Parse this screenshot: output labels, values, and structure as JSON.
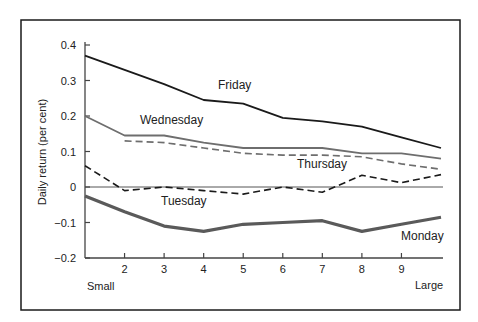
{
  "chart_data": {
    "type": "line",
    "title": "",
    "xlabel": "",
    "ylabel": "Daily return (per cent)",
    "x": [
      1,
      2,
      3,
      4,
      5,
      6,
      7,
      8,
      9,
      10
    ],
    "x_tick_labels": [
      "",
      "2",
      "3",
      "4",
      "5",
      "6",
      "7",
      "8",
      "9",
      ""
    ],
    "x_end_labels": {
      "left": "Small",
      "right": "Large"
    },
    "y_ticks": [
      0.4,
      0.3,
      0.2,
      0.1,
      0,
      -0.1,
      -0.2
    ],
    "y_tick_labels": [
      "0.4",
      "0.3",
      "0.2",
      "0.1",
      "0",
      "−0.1",
      "−0.2"
    ],
    "ylim": [
      -0.2,
      0.4
    ],
    "xlim": [
      1,
      10
    ],
    "grid": false,
    "zero_line": true,
    "legend": "inline labels",
    "series": [
      {
        "name": "Friday",
        "style": "solid",
        "color": "#1a1a1a",
        "width": 1.8,
        "values": [
          0.37,
          0.33,
          0.29,
          0.245,
          0.235,
          0.195,
          0.185,
          0.17,
          0.14,
          0.11
        ],
        "label_pos": [
          218,
          89
        ]
      },
      {
        "name": "Wednesday",
        "style": "solid",
        "color": "#6e6e6e",
        "width": 1.8,
        "values": [
          0.2,
          0.145,
          0.145,
          0.125,
          0.11,
          0.11,
          0.11,
          0.095,
          0.095,
          0.08
        ],
        "label_pos": [
          140,
          124
        ]
      },
      {
        "name": "Thursday",
        "style": "dashed",
        "color": "#6e6e6e",
        "width": 1.6,
        "values": [
          null,
          0.13,
          0.125,
          0.11,
          0.095,
          0.09,
          0.09,
          0.085,
          0.065,
          0.05
        ],
        "label_pos": [
          297,
          168
        ]
      },
      {
        "name": "Tuesday",
        "style": "dashed",
        "color": "#1a1a1a",
        "width": 1.6,
        "values": [
          0.06,
          -0.01,
          0.0,
          -0.01,
          -0.02,
          0.0,
          -0.015,
          0.033,
          0.012,
          0.035
        ],
        "label_pos": [
          161,
          205
        ]
      },
      {
        "name": "Monday",
        "style": "solid",
        "color": "#5a5a5a",
        "width": 3.2,
        "values": [
          -0.025,
          -0.07,
          -0.11,
          -0.125,
          -0.105,
          -0.1,
          -0.095,
          -0.125,
          -0.105,
          -0.085
        ],
        "label_pos": [
          401,
          240
        ]
      }
    ]
  }
}
